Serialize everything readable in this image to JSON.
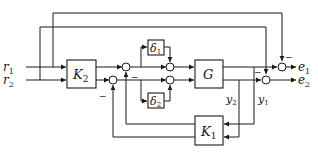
{
  "diagram": {
    "type": "block-diagram",
    "inputs": {
      "r1": "r",
      "r1_sub": "1",
      "r2": "r",
      "r2_sub": "2"
    },
    "outputs": {
      "e1": "e",
      "e1_sub": "1",
      "e2": "e",
      "e2_sub": "2"
    },
    "blocks": {
      "k2": {
        "main": "K",
        "sub": "2"
      },
      "k1": {
        "main": "K",
        "sub": "1"
      },
      "g": {
        "main": "G"
      },
      "delta1": {
        "main": "δ",
        "sub": "1"
      },
      "delta2": {
        "main": "δ",
        "sub": "2"
      }
    },
    "signals": {
      "y1": {
        "main": "y",
        "sub": "1"
      },
      "y2": {
        "main": "y",
        "sub": "2"
      }
    },
    "signs": {
      "minus": "−"
    }
  }
}
